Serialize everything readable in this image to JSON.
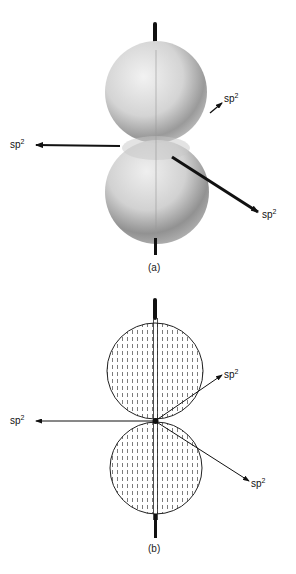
{
  "figure": {
    "panel_a": {
      "caption": "(a)",
      "labels": {
        "upper_right": {
          "base": "sp",
          "sup": "2"
        },
        "left": {
          "base": "sp",
          "sup": "2"
        },
        "lower_right": {
          "base": "sp",
          "sup": "2"
        }
      }
    },
    "panel_b": {
      "caption": "(b)",
      "labels": {
        "upper_right": {
          "base": "sp",
          "sup": "2"
        },
        "left": {
          "base": "sp",
          "sup": "2"
        },
        "lower_right": {
          "base": "sp",
          "sup": "2"
        }
      }
    }
  },
  "colors": {
    "ink": "#111111",
    "sphere_light": "#e8e8e8",
    "sphere_dark": "#8a8a8a"
  }
}
